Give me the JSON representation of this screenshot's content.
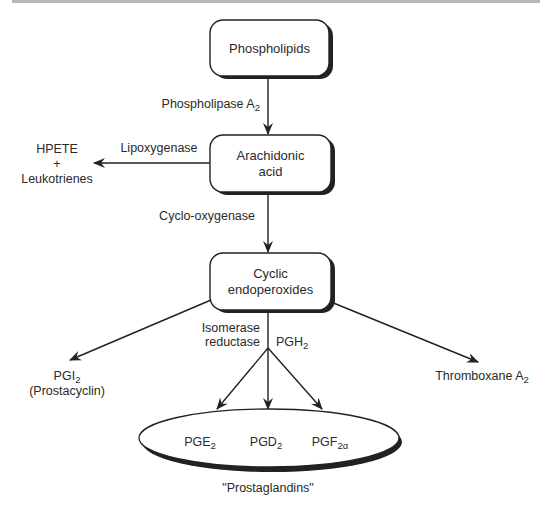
{
  "nodes": {
    "phospholipids": {
      "label": "Phospholipids"
    },
    "arachidonic": {
      "line1": "Arachidonic",
      "line2": "acid"
    },
    "cyclic": {
      "line1": "Cyclic",
      "line2": "endoperoxides"
    },
    "hpete": {
      "line1": "HPETE",
      "line2": "+",
      "line3": "Leukotrienes"
    },
    "pgi2": {
      "base": "PGI",
      "sub": "2",
      "line2": "(Prostacyclin)"
    },
    "thromboxane": {
      "base": "Thromboxane A",
      "sub": "2"
    },
    "prostaglandins": {
      "items": [
        {
          "base": "PGE",
          "sub": "2"
        },
        {
          "base": "PGD",
          "sub": "2"
        },
        {
          "base": "PGF",
          "sub": "2α"
        }
      ],
      "caption": "\"Prostaglandins\""
    }
  },
  "edges": {
    "phospholipase": {
      "base": "Phospholipase A",
      "sub": "2"
    },
    "lipoxygenase": {
      "label": "Lipoxygenase"
    },
    "cyclooxygenase": {
      "label": "Cyclo-oxygenase"
    },
    "isomerase": {
      "line1": "Isomerase",
      "line2": "reductase"
    },
    "pgh2": {
      "base": "PGH",
      "sub": "2"
    }
  }
}
